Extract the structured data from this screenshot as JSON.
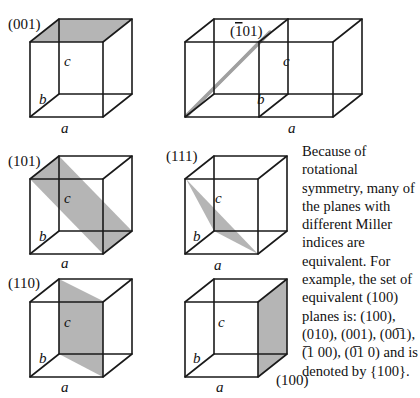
{
  "diagram": {
    "cubes": [
      {
        "id": "001",
        "label": "(001)",
        "axes": {
          "a": "a",
          "b": "b",
          "c": "c"
        },
        "plane": "top face shaded"
      },
      {
        "id": "-101",
        "label": "(̄101)",
        "label_text": "(-101)",
        "label_parts": {
          "bar": "1",
          "rest": "01)"
        },
        "axes": {
          "a": "a",
          "b": "b",
          "c": "c"
        },
        "plane": "diagonal plane across two adjacent cells"
      },
      {
        "id": "101",
        "label": "(101)",
        "axes": {
          "a": "a",
          "b": "b",
          "c": "c"
        },
        "plane": "diagonal plane from top-back-left edge to bottom-front-right edge"
      },
      {
        "id": "111",
        "label": "(111)",
        "axes": {
          "a": "a",
          "b": "b",
          "c": "c"
        },
        "plane": "triangular plane"
      },
      {
        "id": "110",
        "label": "(110)",
        "axes": {
          "a": "a",
          "b": "b",
          "c": "c"
        },
        "plane": "vertical diagonal plane"
      },
      {
        "id": "100",
        "label": "(100)",
        "axes": {
          "a": "a",
          "b": "b",
          "c": "c"
        },
        "plane": "right face shaded"
      }
    ],
    "caption": {
      "lines": [
        "Because of",
        "rotational",
        "symmetry, many of",
        "the planes with",
        "different Miller",
        "indices are",
        "equivalent. For",
        "example, the set of",
        "equivalent (100)",
        "planes is: (100),",
        "(010), (001), (00̅1),",
        "(̅1 00), (0̅1 0) and is",
        "denoted by {100}."
      ]
    },
    "colors": {
      "plane_fill": "#a8a8a8",
      "edge": "#1a1a1a",
      "background": "#ffffff"
    }
  }
}
